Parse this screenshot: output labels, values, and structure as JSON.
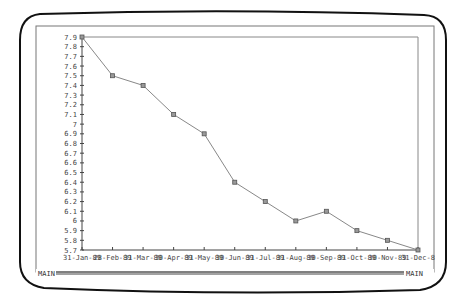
{
  "window": {
    "frame_label_left": "MAIN",
    "frame_label_right": "MAIN"
  },
  "chart_data": {
    "type": "line",
    "title": "",
    "xlabel": "",
    "ylabel": "",
    "categories": [
      "31-Jan-89",
      "28-Feb-89",
      "31-Mar-89",
      "30-Apr-89",
      "31-May-89",
      "30-Jun-89",
      "31-Jul-89",
      "31-Aug-89",
      "30-Sep-89",
      "31-Oct-89",
      "30-Nov-89",
      "31-Dec-89"
    ],
    "x_tick_labels_rendered": [
      "31-Jan-89",
      "28-Feb-89",
      "31-Mar-89",
      "30-Apr-89",
      "31-May-89",
      "30-Jun-89",
      "31-Jul-89",
      "31-Aug-89",
      "30-Sep-89",
      "31-Oct-89",
      "30-Nov-89",
      "31-Dec-8"
    ],
    "values": [
      7.9,
      7.5,
      7.4,
      7.1,
      6.9,
      6.4,
      6.2,
      6.0,
      6.1,
      5.9,
      5.8,
      5.7
    ],
    "ylim": [
      5.7,
      7.9
    ],
    "y_ticks": [
      "7.9",
      "7.8",
      "7.7",
      "7.6",
      "7.5",
      "7.4",
      "7.3",
      "7.2",
      "7.1",
      "7",
      "6.9",
      "6.8",
      "6.7",
      "6.6",
      "6.5",
      "6.4",
      "6.3",
      "6.2",
      "6.1",
      "6",
      "5.9",
      "5.8",
      "5.7"
    ],
    "grid": false,
    "legend": null,
    "marker": "square",
    "line_color": "#888888",
    "marker_color": "#555555"
  }
}
